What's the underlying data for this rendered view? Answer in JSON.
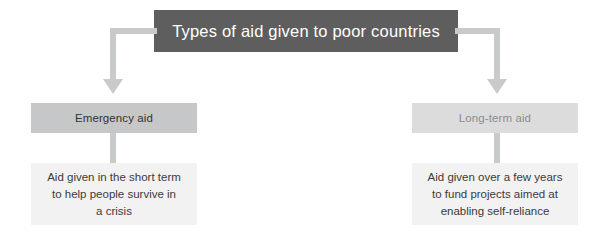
{
  "diagram": {
    "type": "tree-flowchart",
    "root": {
      "label": "Types of aid given to poor countries",
      "fill_color": "#5e5e5e",
      "text_color": "#ffffff"
    },
    "branches": [
      {
        "id": "emergency",
        "category_label": "Emergency aid",
        "category_fill": "#c6c7c8",
        "category_text_color": "#333333",
        "description_lines": [
          "Aid given in the short term",
          "to help people survive in",
          "a crisis"
        ],
        "description_fill": "#f2f2f2"
      },
      {
        "id": "long-term",
        "category_label": "Long-term aid",
        "category_fill": "#dcdcdc",
        "category_text_color": "#8d8d8d",
        "description_lines": [
          "Aid given over a few years",
          "to fund projects aimed at",
          "enabling self-reliance"
        ],
        "description_fill": "#f2f2f2"
      }
    ],
    "connector_color": "#c9cacb",
    "background_color": "#ffffff"
  }
}
